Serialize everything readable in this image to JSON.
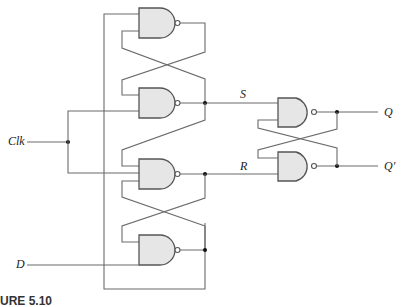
{
  "figure": {
    "caption": "URE 5.10"
  },
  "labels": {
    "clk": "Clk",
    "d": "D",
    "s": "S",
    "r": "R",
    "q": "Q",
    "q_prime": "Q′"
  },
  "gates": [
    {
      "id": "gate-1",
      "type": "NAND",
      "inputs": 2,
      "position": "top"
    },
    {
      "id": "gate-2",
      "type": "NAND",
      "inputs": 2,
      "position": "second",
      "output": "S"
    },
    {
      "id": "gate-3",
      "type": "NAND",
      "inputs": 3,
      "position": "third",
      "output": "R"
    },
    {
      "id": "gate-4",
      "type": "NAND",
      "inputs": 2,
      "position": "bottom"
    },
    {
      "id": "gate-5",
      "type": "NAND",
      "inputs": 2,
      "position": "output-latch-top",
      "output": "Q"
    },
    {
      "id": "gate-6",
      "type": "NAND",
      "inputs": 2,
      "position": "output-latch-bottom",
      "output": "Q′"
    }
  ],
  "colors": {
    "wire": "#6b6b6b",
    "gate_fill": "#e6e6e6",
    "gate_stroke": "#555555",
    "junction": "#111111"
  }
}
